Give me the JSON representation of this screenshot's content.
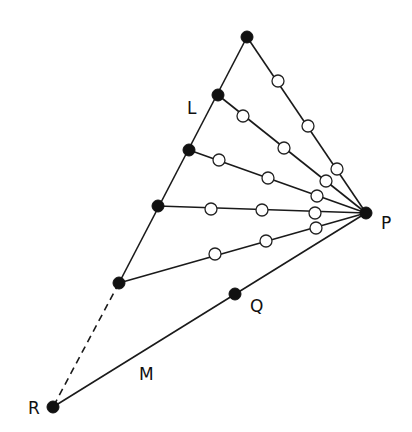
{
  "diagram": {
    "labels": [
      {
        "id": "L",
        "text": "L",
        "x": 187,
        "y": 114
      },
      {
        "id": "P",
        "text": "P",
        "x": 381,
        "y": 229
      },
      {
        "id": "Q",
        "text": "Q",
        "x": 250,
        "y": 312
      },
      {
        "id": "M",
        "text": "M",
        "x": 139,
        "y": 380
      },
      {
        "id": "R",
        "text": "R",
        "x": 28,
        "y": 414
      }
    ],
    "filled_nodes": [
      {
        "id": "top",
        "x": 247,
        "y": 37
      },
      {
        "id": "L1",
        "x": 218,
        "y": 95
      },
      {
        "id": "L2",
        "x": 189,
        "y": 150
      },
      {
        "id": "L3",
        "x": 158,
        "y": 206
      },
      {
        "id": "L4",
        "x": 119,
        "y": 283
      },
      {
        "id": "P",
        "x": 366,
        "y": 213
      },
      {
        "id": "Q",
        "x": 235,
        "y": 294
      },
      {
        "id": "R",
        "x": 53,
        "y": 407
      }
    ],
    "open_nodes": [
      {
        "x": 278,
        "y": 81
      },
      {
        "x": 308,
        "y": 126
      },
      {
        "x": 337,
        "y": 169
      },
      {
        "x": 243,
        "y": 116
      },
      {
        "x": 284,
        "y": 148
      },
      {
        "x": 326,
        "y": 181
      },
      {
        "x": 219,
        "y": 160
      },
      {
        "x": 268,
        "y": 178
      },
      {
        "x": 317,
        "y": 196
      },
      {
        "x": 211,
        "y": 209
      },
      {
        "x": 262,
        "y": 210
      },
      {
        "x": 315,
        "y": 213
      },
      {
        "x": 215,
        "y": 254
      },
      {
        "x": 266,
        "y": 241
      },
      {
        "x": 316,
        "y": 228
      }
    ],
    "edges": [
      {
        "from": "top",
        "to": "L4",
        "x1": 247,
        "y1": 37,
        "x2": 119,
        "y2": 283,
        "dashed": false
      },
      {
        "from": "L4",
        "to": "R",
        "x1": 119,
        "y1": 283,
        "x2": 53,
        "y2": 407,
        "dashed": true
      },
      {
        "from": "top",
        "to": "P",
        "x1": 247,
        "y1": 37,
        "x2": 366,
        "y2": 213,
        "dashed": false
      },
      {
        "from": "L1",
        "to": "P",
        "x1": 218,
        "y1": 95,
        "x2": 366,
        "y2": 213,
        "dashed": false
      },
      {
        "from": "L2",
        "to": "P",
        "x1": 189,
        "y1": 150,
        "x2": 366,
        "y2": 213,
        "dashed": false
      },
      {
        "from": "L3",
        "to": "P",
        "x1": 158,
        "y1": 206,
        "x2": 366,
        "y2": 213,
        "dashed": false
      },
      {
        "from": "L4",
        "to": "P",
        "x1": 119,
        "y1": 283,
        "x2": 366,
        "y2": 213,
        "dashed": false
      },
      {
        "from": "R",
        "to": "P",
        "x1": 53,
        "y1": 407,
        "x2": 366,
        "y2": 213,
        "dashed": false
      }
    ],
    "style": {
      "filled_radius": 6,
      "open_radius": 6,
      "line_color": "#1a1a1a",
      "background": "#ffffff"
    }
  }
}
